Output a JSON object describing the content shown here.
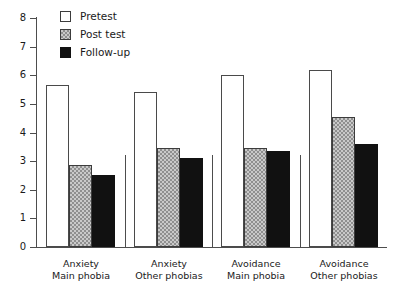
{
  "chart_data": {
    "type": "bar",
    "title": "",
    "subtitle": "",
    "xlabel": "",
    "ylabel": "",
    "ylim": [
      0,
      8
    ],
    "yticks": [
      0,
      1,
      2,
      3,
      4,
      5,
      6,
      7,
      8
    ],
    "ytick_labels": [
      "0",
      "1",
      "2",
      "3",
      "4",
      "5",
      "6",
      "7",
      "8"
    ],
    "grid": false,
    "legend_position": "top-left",
    "categories": [
      "Anxiety Main phobia",
      "Anxiety Other phobias",
      "Avoidance Main phobia",
      "Avoidance Other phobias"
    ],
    "category_lines": [
      {
        "line1": "Anxiety",
        "line2": "Main phobia"
      },
      {
        "line1": "Anxiety",
        "line2": "Other phobias"
      },
      {
        "line1": "Avoidance",
        "line2": "Main phobia"
      },
      {
        "line1": "Avoidance",
        "line2": "Other phobias"
      }
    ],
    "series": [
      {
        "name": "Pretest",
        "fill": "white",
        "color": "#ffffff",
        "values": [
          5.65,
          5.4,
          6.0,
          6.2
        ]
      },
      {
        "name": "Post test",
        "fill": "stippled",
        "color": "#c9c9c9",
        "values": [
          2.85,
          3.45,
          3.45,
          4.55
        ]
      },
      {
        "name": "Follow-up",
        "fill": "solid",
        "color": "#111111",
        "values": [
          2.5,
          3.1,
          3.35,
          3.6
        ]
      }
    ]
  },
  "legend": {
    "items": [
      {
        "label": "Pretest"
      },
      {
        "label": "Post test"
      },
      {
        "label": "Follow-up"
      }
    ]
  },
  "axis": {
    "y_labels": [
      "8",
      "7",
      "6",
      "5",
      "4",
      "3",
      "2",
      "1",
      "0"
    ]
  }
}
